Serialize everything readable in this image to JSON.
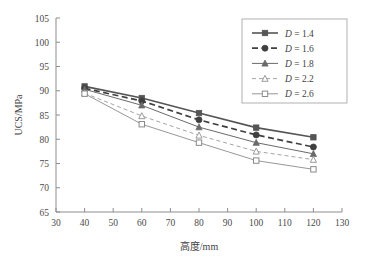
{
  "chart_data": {
    "type": "line",
    "title": "",
    "xlabel": "高度/mm",
    "ylabel": "UCS/MPa",
    "x": [
      40,
      60,
      80,
      100,
      120
    ],
    "xlim": [
      30,
      130
    ],
    "ylim": [
      65,
      105
    ],
    "xticks": [
      30,
      40,
      50,
      60,
      70,
      80,
      90,
      100,
      110,
      120,
      130
    ],
    "yticks": [
      65,
      70,
      75,
      80,
      85,
      90,
      95,
      100,
      105
    ],
    "grid": false,
    "legend_position": "upper-right",
    "series": [
      {
        "name": "D = 1.4",
        "label_var": "D",
        "label_value": "1.4",
        "marker": "filled-square",
        "linestyle": "solid",
        "linewidth": 1.6,
        "color": "#555555",
        "values": [
          90.9,
          88.5,
          85.4,
          82.4,
          80.4
        ]
      },
      {
        "name": "D = 1.6",
        "label_var": "D",
        "label_value": "1.6",
        "marker": "filled-circle",
        "linestyle": "dashed",
        "linewidth": 1.7,
        "color": "#3f3f3f",
        "values": [
          90.5,
          87.9,
          84.0,
          80.9,
          78.4
        ]
      },
      {
        "name": "D = 1.8",
        "label_var": "D",
        "label_value": "1.8",
        "marker": "filled-triangle",
        "linestyle": "solid",
        "linewidth": 1.0,
        "color": "#6a6a6a",
        "values": [
          90.3,
          87.0,
          82.5,
          79.3,
          77.0
        ]
      },
      {
        "name": "D = 2.2",
        "label_var": "D",
        "label_value": "2.2",
        "marker": "open-triangle",
        "linestyle": "dashed-thin",
        "linewidth": 0.9,
        "color": "#9a9a9a",
        "values": [
          89.5,
          84.8,
          80.8,
          77.5,
          75.8
        ]
      },
      {
        "name": "D = 2.6",
        "label_var": "D",
        "label_value": "2.6",
        "marker": "open-square",
        "linestyle": "solid",
        "linewidth": 0.9,
        "color": "#8b8b8b",
        "values": [
          89.4,
          83.1,
          79.3,
          75.6,
          73.8
        ]
      }
    ]
  },
  "colors": {
    "axis": "#8d8d8d",
    "text": "#3f3f3f",
    "background": "#ffffff",
    "legend_border": "#a8a8a8"
  }
}
